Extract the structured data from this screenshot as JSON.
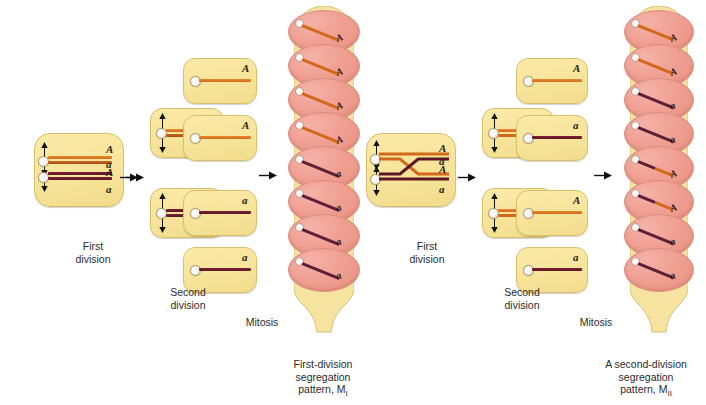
{
  "figure": {
    "allele_dominant": "A",
    "allele_recessive": "a",
    "colors": {
      "cell_fill": "#f7e49a",
      "cell_border": "#d8c06a",
      "chromatid_A": "#d2691a",
      "chromatid_a": "#5c1626",
      "spore_fill": "#f0a093",
      "ascus_fill": "#f7e49a",
      "arrow": "#1a1a1a"
    }
  },
  "panels": [
    {
      "id": "left-panel",
      "name": "first-division-segregation",
      "labels": {
        "first_division": {
          "line1": "First",
          "line2": "division"
        },
        "second_division": {
          "line1": "Second",
          "line2": "division"
        },
        "mitosis": "Mitosis",
        "caption": {
          "line1": "First-division",
          "line2": "segregation",
          "line3": "pattern, M",
          "subscript": "I"
        }
      },
      "meiocyte": {
        "name": "meiocyte-cell",
        "chromosomes": [
          {
            "color": "A",
            "labels": [
              "A",
              "A"
            ]
          },
          {
            "color": "a",
            "labels": [
              "a",
              "a"
            ]
          }
        ]
      },
      "first_division_cells": [
        {
          "name": "first-division-cell-top",
          "labels": [
            "A",
            "A"
          ],
          "color": "A"
        },
        {
          "name": "first-division-cell-bottom",
          "labels": [
            "a",
            "a"
          ],
          "color": "a"
        }
      ],
      "second_division_cells": [
        {
          "name": "second-division-cell-1",
          "label": "A",
          "color": "A"
        },
        {
          "name": "second-division-cell-2",
          "label": "A",
          "color": "A"
        },
        {
          "name": "second-division-cell-3",
          "label": "a",
          "color": "a"
        },
        {
          "name": "second-division-cell-4",
          "label": "a",
          "color": "a"
        }
      ],
      "ascospores": [
        {
          "label": "A",
          "color": "A"
        },
        {
          "label": "A",
          "color": "A"
        },
        {
          "label": "A",
          "color": "A"
        },
        {
          "label": "A",
          "color": "A"
        },
        {
          "label": "a",
          "color": "a"
        },
        {
          "label": "a",
          "color": "a"
        },
        {
          "label": "a",
          "color": "a"
        },
        {
          "label": "a",
          "color": "a"
        }
      ]
    },
    {
      "id": "right-panel",
      "name": "second-division-segregation",
      "labels": {
        "first_division": {
          "line1": "First",
          "line2": "division"
        },
        "second_division": {
          "line1": "Second",
          "line2": "division"
        },
        "mitosis": "Mitosis",
        "caption": {
          "line1": "A second-division",
          "line2": "segregation",
          "line3": "pattern, M",
          "subscript": "II"
        }
      },
      "meiocyte": {
        "name": "meiocyte-cell-crossover",
        "crossover": true,
        "labels": [
          "A",
          "A",
          "a",
          "a"
        ]
      },
      "first_division_cells": [
        {
          "name": "first-division-cell-top",
          "labels": [
            "A",
            "a"
          ],
          "recombinant": true
        },
        {
          "name": "first-division-cell-bottom",
          "labels": [
            "A",
            "a"
          ],
          "recombinant": true
        }
      ],
      "second_division_cells": [
        {
          "name": "second-division-cell-1",
          "label": "A",
          "color": "A"
        },
        {
          "name": "second-division-cell-2",
          "label": "a",
          "color": "a"
        },
        {
          "name": "second-division-cell-3",
          "label": "A",
          "color": "A"
        },
        {
          "name": "second-division-cell-4",
          "label": "a",
          "color": "a"
        }
      ],
      "ascospores": [
        {
          "label": "A",
          "color": "A"
        },
        {
          "label": "A",
          "color": "A"
        },
        {
          "label": "a",
          "color": "a"
        },
        {
          "label": "a",
          "color": "a"
        },
        {
          "label": "A",
          "color": "A"
        },
        {
          "label": "A",
          "color": "A"
        },
        {
          "label": "a",
          "color": "a"
        },
        {
          "label": "a",
          "color": "a"
        }
      ]
    }
  ]
}
